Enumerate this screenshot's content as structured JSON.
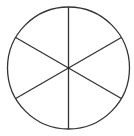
{
  "diagram": {
    "type": "circle-divided-into-sectors",
    "sectors": 6,
    "center": [
      68.5,
      68
    ],
    "radius": 61,
    "stroke_color": "#333333",
    "fill_color": "#ffffff",
    "stroke_width": 1.3,
    "start_angle_deg": -90
  }
}
